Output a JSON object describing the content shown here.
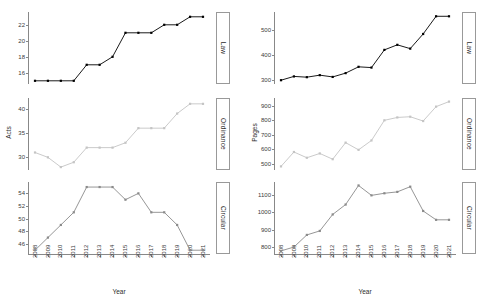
{
  "figure": {
    "background": "#ffffff",
    "xlabel": "Year",
    "panel_labels": [
      "Law",
      "Ordinance",
      "Circular"
    ],
    "colors": {
      "law": "#000000",
      "ordinance": "#c4c4c4",
      "circular": "#8a8a8a",
      "axis": "#888888",
      "text": "#2b2b2b"
    }
  },
  "chart_data": [
    {
      "type": "line",
      "title": "",
      "xlabel": "Year",
      "ylabel": "Acts",
      "grid": false,
      "legend": "none",
      "x": [
        2008,
        2009,
        2010,
        2011,
        2012,
        2013,
        2014,
        2015,
        2016,
        2017,
        2018,
        2019,
        2020,
        2021
      ],
      "panels": [
        {
          "label": "Law",
          "color": "#000000",
          "values": [
            15,
            15,
            15,
            15,
            17,
            17,
            18,
            21,
            21,
            21,
            22,
            22,
            23,
            23
          ],
          "ylim": [
            14.6,
            23.6
          ],
          "yticks": [
            16,
            18,
            20,
            22
          ]
        },
        {
          "label": "Ordinance",
          "color": "#c4c4c4",
          "values": [
            31,
            30,
            28,
            29,
            32,
            32,
            32,
            33,
            36,
            36,
            36,
            39,
            41,
            41
          ],
          "ylim": [
            27.4,
            42.2
          ],
          "yticks": [
            30,
            35,
            40
          ]
        },
        {
          "label": "Circular",
          "color": "#8a8a8a",
          "values": [
            45,
            47,
            49,
            51,
            55,
            55,
            55,
            53,
            54,
            51,
            51,
            49,
            45,
            45
          ],
          "ylim": [
            44.4,
            55.8
          ],
          "yticks": [
            46,
            48,
            50,
            52,
            54
          ]
        }
      ]
    },
    {
      "type": "line",
      "title": "",
      "xlabel": "Year",
      "ylabel": "Pages",
      "grid": false,
      "legend": "none",
      "x": [
        2008,
        2009,
        2010,
        2011,
        2012,
        2013,
        2014,
        2015,
        2016,
        2017,
        2018,
        2019,
        2020,
        2021
      ],
      "panels": [
        {
          "label": "Law",
          "color": "#000000",
          "values": [
            300,
            315,
            312,
            320,
            313,
            328,
            353,
            350,
            420,
            440,
            425,
            483,
            553,
            553
          ],
          "ylim": [
            285,
            570
          ],
          "yticks": [
            300,
            400,
            500
          ]
        },
        {
          "label": "Ordinance",
          "color": "#c4c4c4",
          "values": [
            480,
            580,
            540,
            570,
            530,
            645,
            595,
            660,
            800,
            820,
            825,
            795,
            895,
            930
          ],
          "ylim": [
            455,
            955
          ],
          "yticks": [
            500,
            600,
            700,
            800,
            900
          ]
        },
        {
          "label": "Circular",
          "color": "#8a8a8a",
          "values": [
            778,
            800,
            870,
            893,
            988,
            1045,
            1155,
            1098,
            1110,
            1118,
            1148,
            1008,
            957,
            957
          ],
          "ylim": [
            760,
            1175
          ],
          "yticks": [
            800,
            900,
            1000,
            1100
          ]
        }
      ]
    }
  ]
}
